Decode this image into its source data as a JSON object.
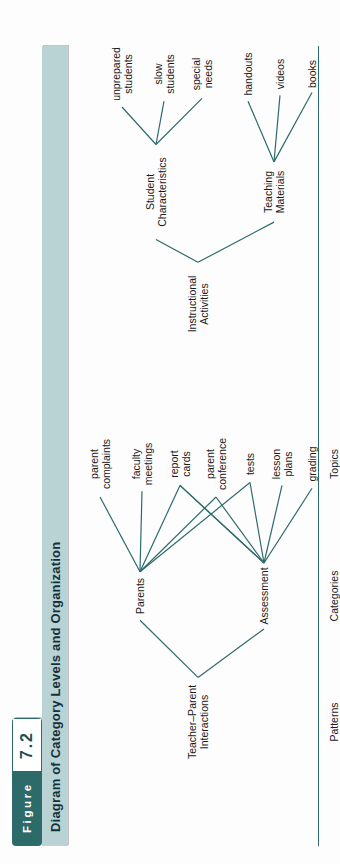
{
  "figure": {
    "label_word": "Figure",
    "number": "7.2",
    "title": "Diagram of Category Levels and Organization"
  },
  "colors": {
    "header_teal": "#2d6b6b",
    "title_band": "#b9d2d4",
    "line": "#2d6b6b",
    "text": "#1a1a1a"
  },
  "row_labels": [
    {
      "id": "patterns",
      "text": "Patterns"
    },
    {
      "id": "categories",
      "text": "Categories"
    },
    {
      "id": "topics",
      "text": "Topics"
    }
  ],
  "diagram": {
    "type": "tree",
    "levels": [
      "Patterns",
      "Categories",
      "Topics"
    ],
    "patterns": [
      {
        "id": "instructional-activities",
        "text": "Instructional\nActivities"
      },
      {
        "id": "teacher-parent-interactions",
        "text": "Teacher–Parent\nInteractions"
      }
    ],
    "categories": [
      {
        "id": "teaching-materials",
        "text": "Teaching\nMaterials",
        "parent": "instructional-activities"
      },
      {
        "id": "student-characteristics",
        "text": "Student\nCharacteristics",
        "parent": "instructional-activities"
      },
      {
        "id": "assessment",
        "text": "Assessment",
        "parent": "teacher-parent-interactions"
      },
      {
        "id": "parents",
        "text": "Parents",
        "parent": "teacher-parent-interactions"
      }
    ],
    "topics": [
      {
        "id": "books",
        "text": "books",
        "parent": "teaching-materials"
      },
      {
        "id": "videos",
        "text": "videos",
        "parent": "teaching-materials"
      },
      {
        "id": "handouts",
        "text": "handouts",
        "parent": "teaching-materials"
      },
      {
        "id": "special-needs",
        "text": "special\nneeds",
        "parent": "student-characteristics"
      },
      {
        "id": "slow-students",
        "text": "slow\nstudents",
        "parent": "student-characteristics"
      },
      {
        "id": "unprepared-students",
        "text": "unprepared\nstudents",
        "parent": "student-characteristics"
      },
      {
        "id": "grading",
        "text": "grading",
        "parent": "assessment"
      },
      {
        "id": "lesson-plans",
        "text": "lesson\nplans",
        "parent": "assessment"
      },
      {
        "id": "tests",
        "text": "tests",
        "parent": "assessment"
      },
      {
        "id": "parent-conference",
        "text": "parent\nconference",
        "parent": "assessment"
      },
      {
        "id": "report-cards",
        "text": "report\ncards",
        "parent": "assessment"
      },
      {
        "id": "faculty-meetings",
        "text": "faculty\nmeetings",
        "parent": "parents"
      },
      {
        "id": "parent-complaints",
        "text": "parent\ncomplaints",
        "parent": "parents"
      }
    ],
    "extra_links": [
      {
        "from": "assessment",
        "to": "report-cards"
      },
      {
        "from": "parents",
        "to": "parent-conference"
      },
      {
        "from": "parents",
        "to": "report-cards"
      },
      {
        "from": "parents",
        "to": "tests"
      }
    ]
  }
}
